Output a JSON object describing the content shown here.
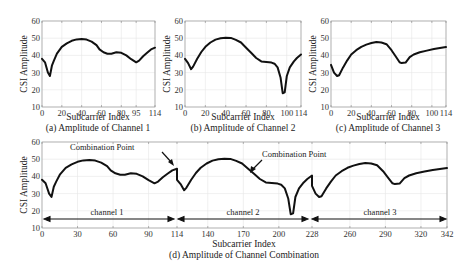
{
  "chart_data": [
    {
      "type": "line",
      "panel": "a",
      "caption": "(a) Amplitude of Channel 1",
      "xlabel": "Subcarrier Index",
      "ylabel": "CSI Amplitude",
      "xlim": [
        0,
        114
      ],
      "ylim": [
        10,
        60
      ],
      "xticks": [
        0,
        20,
        40,
        60,
        80,
        95,
        114
      ],
      "yticks": [
        10,
        20,
        30,
        40,
        50,
        60
      ],
      "grid": true,
      "x": [
        0,
        3,
        6,
        8,
        10,
        12,
        15,
        20,
        25,
        30,
        35,
        40,
        45,
        50,
        55,
        58,
        62,
        66,
        70,
        75,
        80,
        85,
        90,
        95,
        98,
        102,
        106,
        110,
        114
      ],
      "values": [
        38,
        36,
        30,
        28,
        34,
        37,
        41,
        45,
        47,
        48.5,
        49.3,
        49.5,
        49.2,
        48,
        46,
        43.5,
        41.8,
        41,
        41,
        41.8,
        41.5,
        40,
        37.8,
        36,
        37,
        39.5,
        41.5,
        43.5,
        44.5
      ]
    },
    {
      "type": "line",
      "panel": "b",
      "caption": "(b) Amplitude of Channel 2",
      "xlabel": "Subcarrier Index",
      "ylabel": "CSI Amplitude",
      "xlim": [
        0,
        114
      ],
      "ylim": [
        10,
        60
      ],
      "xticks": [
        0,
        20,
        40,
        60,
        80,
        100,
        114
      ],
      "yticks": [
        10,
        20,
        30,
        40,
        50,
        60
      ],
      "grid": true,
      "x": [
        0,
        3,
        6,
        8,
        12,
        16,
        20,
        25,
        30,
        35,
        40,
        45,
        50,
        55,
        60,
        65,
        70,
        75,
        80,
        85,
        88,
        91,
        94,
        96,
        98,
        100,
        103,
        107,
        110,
        114
      ],
      "values": [
        38,
        35.5,
        32,
        33.5,
        38,
        42,
        45,
        47.5,
        49.2,
        50,
        50.3,
        50.2,
        49,
        47.5,
        44.5,
        41.5,
        38.5,
        36.5,
        36.2,
        35.8,
        35.2,
        33,
        27,
        18,
        18.5,
        28,
        33,
        36.5,
        38.5,
        40.5
      ]
    },
    {
      "type": "line",
      "panel": "c",
      "caption": "(c) Amplitude of Channel 3",
      "xlabel": "Subcarrier Index",
      "ylabel": "CSI Amplitude",
      "xlim": [
        0,
        114
      ],
      "ylim": [
        10,
        60
      ],
      "xticks": [
        0,
        20,
        40,
        60,
        80,
        100,
        114
      ],
      "yticks": [
        10,
        20,
        30,
        40,
        50,
        60
      ],
      "grid": true,
      "x": [
        0,
        3,
        6,
        8,
        12,
        16,
        20,
        25,
        30,
        35,
        40,
        45,
        50,
        55,
        60,
        64,
        68,
        70,
        74,
        78,
        82,
        88,
        95,
        102,
        108,
        114
      ],
      "values": [
        34.5,
        30,
        28,
        28.5,
        33,
        37,
        40.5,
        43,
        45,
        46.3,
        47.2,
        47.8,
        47.5,
        46.5,
        43,
        39.5,
        36,
        35.5,
        35.8,
        39,
        40.5,
        41.8,
        42.8,
        43.7,
        44.3,
        44.8
      ]
    },
    {
      "type": "line",
      "panel": "d",
      "caption": "(d) Amplitude of Channel Combination",
      "xlabel": "Subcarrier Index",
      "ylabel": "CSI Amplitude",
      "xlim": [
        0,
        342
      ],
      "ylim": [
        10,
        60
      ],
      "xticks": [
        0,
        30,
        60,
        90,
        114,
        140,
        170,
        200,
        228,
        260,
        290,
        320,
        342
      ],
      "yticks": [
        10,
        20,
        30,
        40,
        50,
        60
      ],
      "grid": true,
      "annotations": [
        {
          "text": "Combination Point",
          "x": 114,
          "y": 44.5
        },
        {
          "text": "Combination Point",
          "x": 228,
          "y": 40.5
        }
      ],
      "ranges": [
        {
          "label": "channel 1",
          "from": 0,
          "to": 114
        },
        {
          "label": "channel 2",
          "from": 114,
          "to": 228
        },
        {
          "label": "channel 3",
          "from": 228,
          "to": 342
        }
      ]
    }
  ],
  "labels": {
    "ylabel": "CSI Amplitude",
    "xlabel": "Subcarrier Index",
    "cap_a": "(a) Amplitude of Channel 1",
    "cap_b": "(b) Amplitude of Channel 2",
    "cap_c": "(c) Amplitude of Channel 3",
    "cap_d": "(d) Amplitude of Channel Combination",
    "combination_point": "Combination Point",
    "channel1": "channel 1",
    "channel2": "channel 2",
    "channel3": "channel 3"
  },
  "ticks": {
    "y": [
      "60",
      "50",
      "40",
      "30",
      "20",
      "10"
    ],
    "xa": [
      "0",
      "20",
      "40",
      "60",
      "80",
      "95",
      "114"
    ],
    "xb": [
      "0",
      "20",
      "40",
      "60",
      "80",
      "100",
      "114"
    ],
    "xc": [
      "0",
      "20",
      "40",
      "60",
      "80",
      "100",
      "114"
    ],
    "xd": [
      "0",
      "30",
      "60",
      "90",
      "114",
      "140",
      "170",
      "200",
      "228",
      "260",
      "290",
      "320",
      "342"
    ]
  }
}
